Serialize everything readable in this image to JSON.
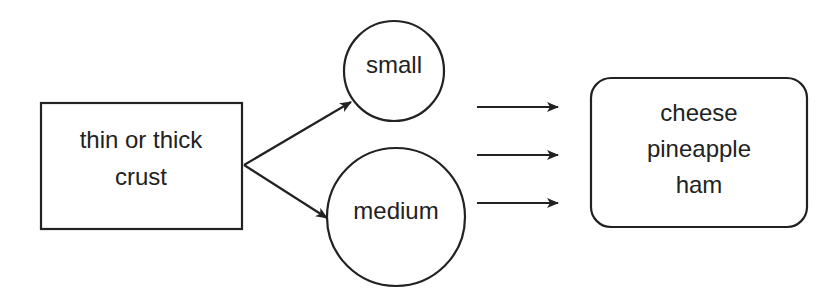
{
  "diagram": {
    "nodes": {
      "crust": {
        "lines": [
          "thin or thick",
          "crust"
        ],
        "shape": "rectangle"
      },
      "small": {
        "label": "small",
        "shape": "circle"
      },
      "medium": {
        "label": "medium",
        "shape": "circle"
      },
      "toppings": {
        "lines": [
          "cheese",
          "pineapple",
          "ham"
        ],
        "shape": "rounded-rectangle"
      }
    },
    "edges": [
      {
        "from": "crust",
        "to": "small"
      },
      {
        "from": "crust",
        "to": "medium"
      },
      {
        "from": "sizes",
        "to": "toppings"
      },
      {
        "from": "sizes",
        "to": "toppings"
      },
      {
        "from": "sizes",
        "to": "toppings"
      }
    ],
    "colors": {
      "stroke": "#222222",
      "background": "#ffffff"
    }
  }
}
